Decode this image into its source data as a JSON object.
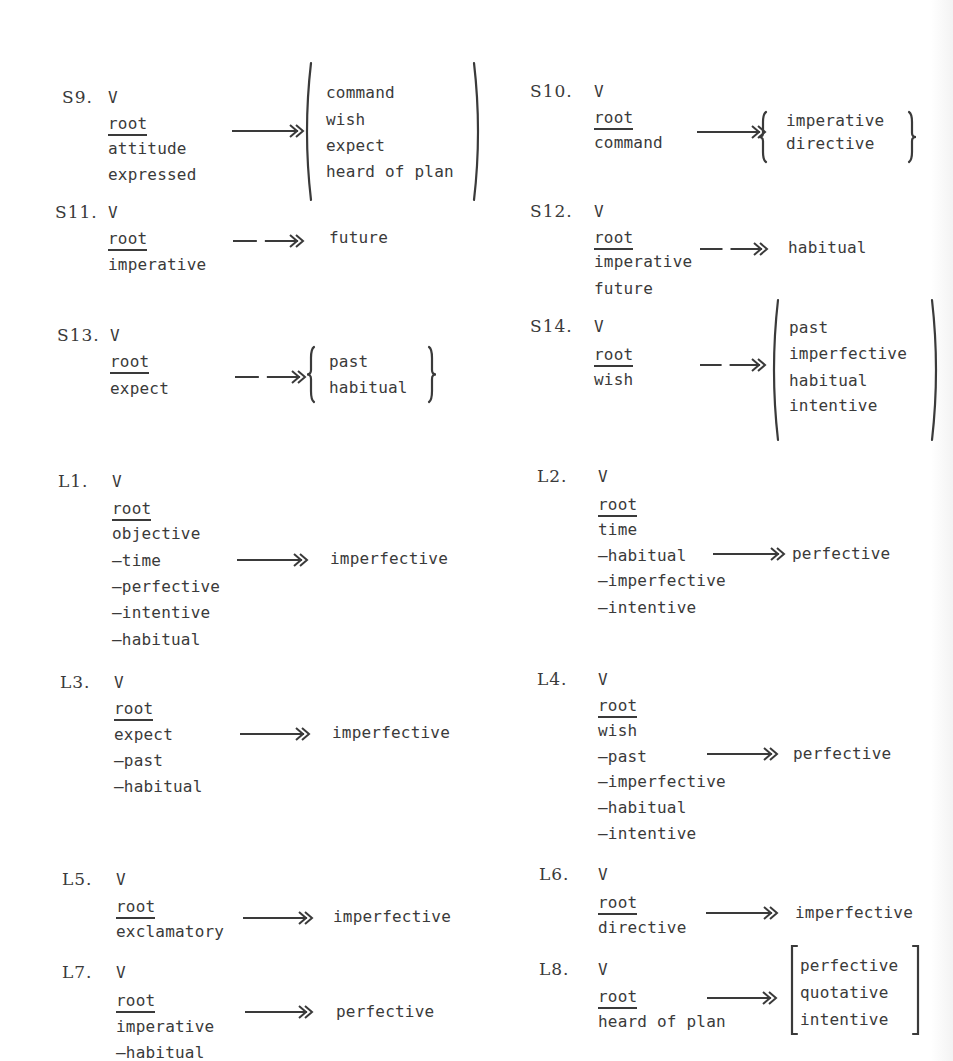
{
  "page": {
    "colors": {
      "ink": "#3a3a3a",
      "paper": "#ffffff"
    }
  },
  "rules": {
    "S9": {
      "label": "S9.",
      "node": "V",
      "root": "root",
      "features": [
        "attitude",
        "expressed"
      ],
      "arrow": "obligatory",
      "bracket": "paren",
      "outputs": [
        "command",
        "wish",
        "expect",
        "heard of plan"
      ]
    },
    "S10": {
      "label": "S10.",
      "node": "V",
      "root": "root",
      "features": [
        "command"
      ],
      "arrow": "obligatory",
      "bracket": "brace",
      "outputs": [
        "imperative",
        "directive"
      ]
    },
    "S11": {
      "label": "S11.",
      "node": "V",
      "root": "root",
      "features": [
        "imperative"
      ],
      "arrow": "optional",
      "bracket": "none",
      "outputs": [
        "future"
      ]
    },
    "S12": {
      "label": "S12.",
      "node": "V",
      "root": "root",
      "features": [
        "imperative",
        "future"
      ],
      "arrow": "optional",
      "bracket": "none",
      "outputs": [
        "habitual"
      ]
    },
    "S13": {
      "label": "S13.",
      "node": "V",
      "root": "root",
      "features": [
        "expect"
      ],
      "arrow": "optional",
      "bracket": "brace",
      "outputs": [
        "past",
        "habitual"
      ]
    },
    "S14": {
      "label": "S14.",
      "node": "V",
      "root": "root",
      "features": [
        "wish"
      ],
      "arrow": "optional",
      "bracket": "paren",
      "outputs": [
        "past",
        "imperfective",
        "habitual",
        "intentive"
      ]
    },
    "L1": {
      "label": "L1.",
      "node": "V",
      "root": "root",
      "features": [
        "objective",
        "–time",
        "–perfective",
        "–intentive",
        "–habitual"
      ],
      "arrow": "obligatory",
      "bracket": "none",
      "outputs": [
        "imperfective"
      ]
    },
    "L2": {
      "label": "L2.",
      "node": "V",
      "root": "root",
      "features": [
        "time",
        "–habitual",
        "–imperfective",
        "–intentive"
      ],
      "arrow": "obligatory",
      "bracket": "none",
      "outputs": [
        "perfective"
      ]
    },
    "L3": {
      "label": "L3.",
      "node": "V",
      "root": "root",
      "features": [
        "expect",
        "–past",
        "–habitual"
      ],
      "arrow": "obligatory",
      "bracket": "none",
      "outputs": [
        "imperfective"
      ]
    },
    "L4": {
      "label": "L4.",
      "node": "V",
      "root": "root",
      "features": [
        "wish",
        "–past",
        "–imperfective",
        "–habitual",
        "–intentive"
      ],
      "arrow": "obligatory",
      "bracket": "none",
      "outputs": [
        "perfective"
      ]
    },
    "L5": {
      "label": "L5.",
      "node": "V",
      "root": "root",
      "features": [
        "exclamatory"
      ],
      "arrow": "obligatory",
      "bracket": "none",
      "outputs": [
        "imperfective"
      ]
    },
    "L6": {
      "label": "L6.",
      "node": "V",
      "root": "root",
      "features": [
        "directive"
      ],
      "arrow": "obligatory",
      "bracket": "none",
      "outputs": [
        "imperfective"
      ]
    },
    "L7": {
      "label": "L7.",
      "node": "V",
      "root": "root",
      "features": [
        "imperative",
        "–habitual"
      ],
      "arrow": "obligatory",
      "bracket": "none",
      "outputs": [
        "perfective"
      ]
    },
    "L8": {
      "label": "L8.",
      "node": "V",
      "root": "root",
      "features": [
        "heard of plan"
      ],
      "arrow": "obligatory",
      "bracket": "square",
      "outputs": [
        "perfective",
        "quotative",
        "intentive"
      ]
    }
  }
}
